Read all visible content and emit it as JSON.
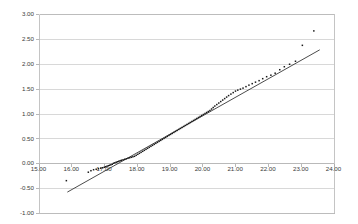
{
  "chart_data": {
    "type": "scatter",
    "title": "",
    "subtitle": "",
    "xlabel": "",
    "ylabel": "",
    "xlim": [
      15.0,
      24.0
    ],
    "ylim": [
      -1.0,
      3.0
    ],
    "xticks": [
      15.0,
      16.0,
      17.0,
      18.0,
      19.0,
      20.0,
      21.0,
      22.0,
      23.0,
      24.0
    ],
    "yticks": [
      -1.0,
      -0.5,
      0.0,
      0.5,
      1.0,
      1.5,
      2.0,
      2.5,
      3.0
    ],
    "xtick_labels": [
      "15.00",
      "16.00",
      "17.00",
      "18.00",
      "19.00",
      "20.00",
      "21.00",
      "22.00",
      "23.00",
      "24.00"
    ],
    "ytick_labels": [
      "-1.00",
      "-0.50",
      "0.00",
      "0.50",
      "1.00",
      "1.50",
      "2.00",
      "2.50",
      "3.00"
    ],
    "grid": "horizontal",
    "legend": "none",
    "point_color": "#1a1a1a",
    "line_color": "#2b2b2b",
    "gridline_color": "#c8c8c8",
    "background_color": "#ffffff",
    "series": [
      {
        "name": "observations",
        "type": "scatter",
        "marker": "square",
        "marker_size": 1.5,
        "points": [
          [
            15.85,
            -0.35
          ],
          [
            16.52,
            -0.18
          ],
          [
            16.6,
            -0.15
          ],
          [
            16.68,
            -0.13
          ],
          [
            16.76,
            -0.12
          ],
          [
            16.83,
            -0.11
          ],
          [
            16.9,
            -0.1
          ],
          [
            16.96,
            -0.09
          ],
          [
            17.01,
            -0.08
          ],
          [
            17.05,
            -0.07
          ],
          [
            17.09,
            -0.06
          ],
          [
            17.13,
            -0.05
          ],
          [
            17.17,
            -0.04
          ],
          [
            17.21,
            -0.03
          ],
          [
            17.25,
            -0.02
          ],
          [
            17.29,
            0.0
          ],
          [
            17.33,
            0.01
          ],
          [
            17.37,
            0.02
          ],
          [
            17.41,
            0.03
          ],
          [
            17.45,
            0.04
          ],
          [
            17.49,
            0.05
          ],
          [
            17.53,
            0.06
          ],
          [
            17.58,
            0.07
          ],
          [
            17.63,
            0.08
          ],
          [
            17.68,
            0.09
          ],
          [
            17.73,
            0.1
          ],
          [
            17.78,
            0.11
          ],
          [
            17.83,
            0.12
          ],
          [
            17.88,
            0.13
          ],
          [
            17.93,
            0.14
          ],
          [
            17.98,
            0.16
          ],
          [
            18.03,
            0.18
          ],
          [
            18.08,
            0.2
          ],
          [
            18.13,
            0.22
          ],
          [
            18.18,
            0.24
          ],
          [
            18.23,
            0.26
          ],
          [
            18.28,
            0.28
          ],
          [
            18.33,
            0.3
          ],
          [
            18.38,
            0.32
          ],
          [
            18.43,
            0.34
          ],
          [
            18.48,
            0.36
          ],
          [
            18.53,
            0.38
          ],
          [
            18.58,
            0.4
          ],
          [
            18.63,
            0.42
          ],
          [
            18.68,
            0.44
          ],
          [
            18.73,
            0.46
          ],
          [
            18.78,
            0.48
          ],
          [
            18.83,
            0.5
          ],
          [
            18.88,
            0.52
          ],
          [
            18.93,
            0.54
          ],
          [
            18.98,
            0.56
          ],
          [
            19.03,
            0.58
          ],
          [
            19.08,
            0.6
          ],
          [
            19.13,
            0.62
          ],
          [
            19.18,
            0.64
          ],
          [
            19.23,
            0.66
          ],
          [
            19.28,
            0.68
          ],
          [
            19.33,
            0.7
          ],
          [
            19.38,
            0.72
          ],
          [
            19.43,
            0.74
          ],
          [
            19.48,
            0.76
          ],
          [
            19.53,
            0.78
          ],
          [
            19.58,
            0.8
          ],
          [
            19.63,
            0.82
          ],
          [
            19.68,
            0.84
          ],
          [
            19.73,
            0.86
          ],
          [
            19.78,
            0.88
          ],
          [
            19.83,
            0.9
          ],
          [
            19.88,
            0.92
          ],
          [
            19.93,
            0.94
          ],
          [
            19.98,
            0.96
          ],
          [
            20.03,
            0.98
          ],
          [
            20.08,
            1.0
          ],
          [
            20.13,
            1.02
          ],
          [
            20.18,
            1.04
          ],
          [
            20.23,
            1.06
          ],
          [
            20.28,
            1.09
          ],
          [
            20.33,
            1.12
          ],
          [
            20.38,
            1.15
          ],
          [
            20.44,
            1.18
          ],
          [
            20.5,
            1.21
          ],
          [
            20.56,
            1.24
          ],
          [
            20.62,
            1.27
          ],
          [
            20.68,
            1.3
          ],
          [
            20.74,
            1.33
          ],
          [
            20.8,
            1.36
          ],
          [
            20.87,
            1.39
          ],
          [
            20.94,
            1.42
          ],
          [
            21.01,
            1.45
          ],
          [
            21.08,
            1.47
          ],
          [
            21.16,
            1.49
          ],
          [
            21.24,
            1.51
          ],
          [
            21.33,
            1.54
          ],
          [
            21.42,
            1.57
          ],
          [
            21.52,
            1.6
          ],
          [
            21.62,
            1.63
          ],
          [
            21.73,
            1.66
          ],
          [
            21.84,
            1.7
          ],
          [
            21.96,
            1.74
          ],
          [
            22.09,
            1.77
          ],
          [
            22.22,
            1.81
          ],
          [
            22.36,
            1.88
          ],
          [
            22.5,
            1.94
          ],
          [
            22.66,
            1.99
          ],
          [
            22.84,
            2.05
          ],
          [
            23.05,
            2.37
          ],
          [
            23.4,
            2.66
          ]
        ]
      },
      {
        "name": "reference-line",
        "type": "line",
        "x_start": 15.88,
        "y_start": -0.58,
        "x_end": 23.58,
        "y_end": 2.28
      }
    ]
  }
}
